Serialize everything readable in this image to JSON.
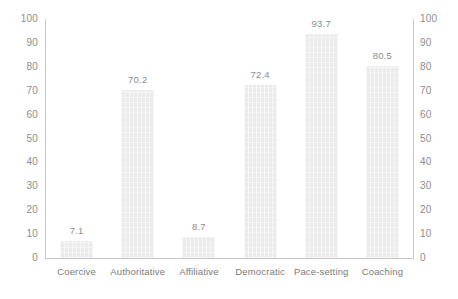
{
  "chart_data": {
    "type": "bar",
    "title": "",
    "subtitle": "",
    "xlabel": "",
    "ylabel": "",
    "categories": [
      "Coercive",
      "Authoritative",
      "Affiliative",
      "Democratic",
      "Pace-setting",
      "Coaching"
    ],
    "values": [
      7.1,
      70.2,
      8.7,
      72.4,
      93.7,
      80.5
    ],
    "value_labels": [
      "7.1",
      "70.2",
      "8.7",
      "72.4",
      "93.7",
      "80.5"
    ],
    "ylim": [
      0,
      100
    ],
    "y_ticks": [
      0,
      10,
      20,
      30,
      40,
      50,
      60,
      70,
      80,
      90,
      100
    ],
    "y_tick_labels_left": [
      "100",
      "90",
      "80",
      "70",
      "60",
      "50",
      "40",
      "30",
      "20",
      "10",
      "0"
    ],
    "y_tick_labels_right": [
      "100",
      "90",
      "80",
      "70",
      "60",
      "50",
      "40",
      "30",
      "20",
      "10",
      "0"
    ],
    "grid": false,
    "legend": null,
    "legend_position": "none",
    "dual_axis": true,
    "bar_color": "#ebebeb",
    "axis_color": "#c8c8c8",
    "text_color": "#8c8c8c",
    "background": "#ffffff"
  }
}
